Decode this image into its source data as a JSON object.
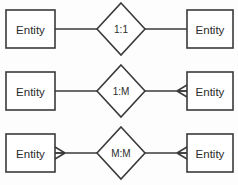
{
  "diagram": {
    "type": "entity-relationship-cardinality-reference",
    "width": 238,
    "height": 185,
    "background_color": "#fdfdfd",
    "stroke_color": "#3a3a3a",
    "fill_color": "#ffffff",
    "text_color": "#2b2b2b",
    "rows": [
      {
        "id": "row-one-to-one",
        "relationship_label": "1:1",
        "left_entity_label": "Entity",
        "right_entity_label": "Entity",
        "left_cardinality": "one",
        "right_cardinality": "one",
        "left_crow_foot": false,
        "right_crow_foot": false,
        "center_y": 29
      },
      {
        "id": "row-one-to-many",
        "relationship_label": "1:M",
        "left_entity_label": "Entity",
        "right_entity_label": "Entity",
        "left_cardinality": "one",
        "right_cardinality": "many",
        "left_crow_foot": false,
        "right_crow_foot": true,
        "center_y": 91
      },
      {
        "id": "row-many-to-many",
        "relationship_label": "M:M",
        "left_entity_label": "Entity",
        "right_entity_label": "Entity",
        "left_cardinality": "many",
        "right_cardinality": "many",
        "left_crow_foot": true,
        "right_crow_foot": true,
        "center_y": 153
      }
    ],
    "geometry": {
      "left_box": {
        "x": 6,
        "width": 49,
        "height": 38
      },
      "right_box": {
        "x": 187,
        "width": 46,
        "height": 38
      },
      "diamond": {
        "center_x": 121,
        "half_width": 24,
        "half_height": 26
      }
    }
  }
}
